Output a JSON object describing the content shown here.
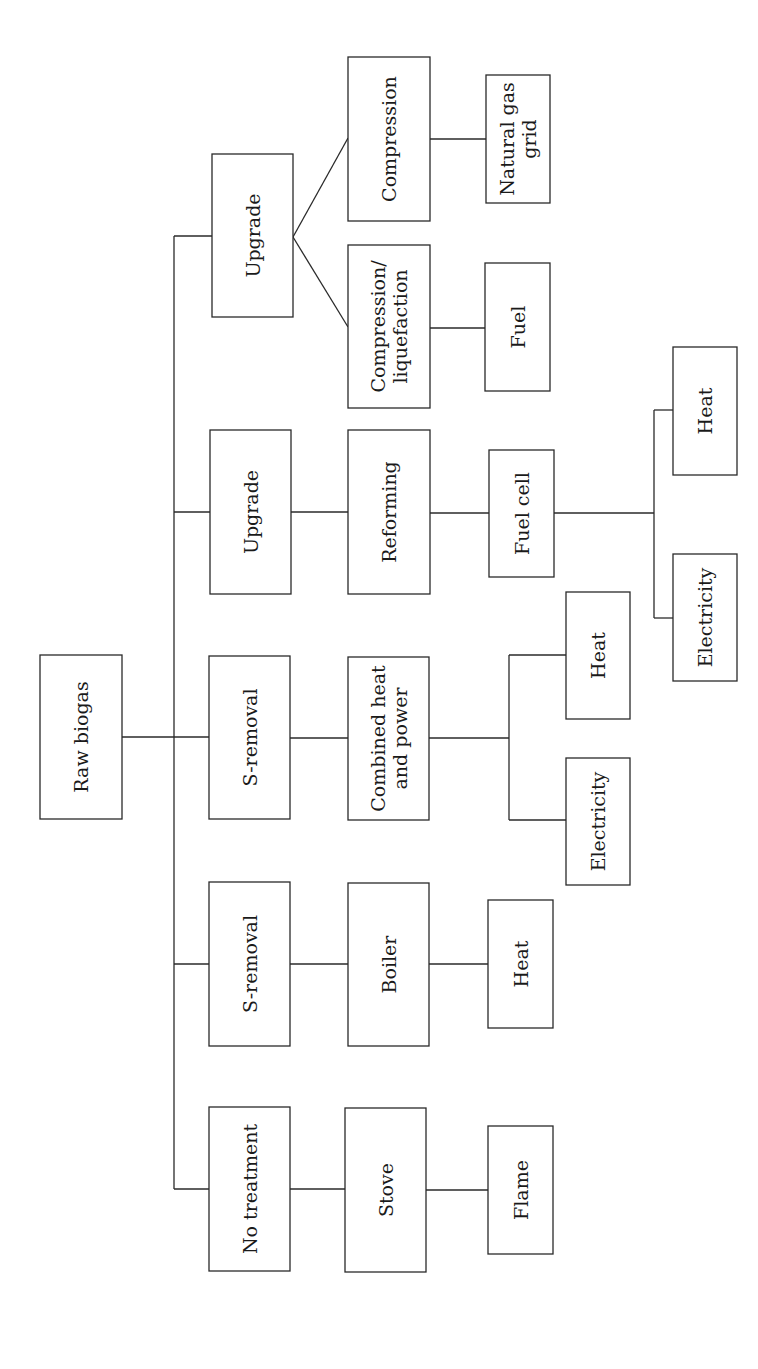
{
  "diagram": {
    "type": "flowchart",
    "orientation": "rotated-90-ccw",
    "root": "Raw biogas",
    "nodes": {
      "raw_biogas": [
        "Raw biogas"
      ],
      "no_treatment": [
        "No treatment"
      ],
      "stove": [
        "Stove"
      ],
      "flame": [
        "Flame"
      ],
      "s_removal_boiler": [
        "S-removal"
      ],
      "boiler": [
        "Boiler"
      ],
      "heat_boiler": [
        "Heat"
      ],
      "s_removal_chp": [
        "S-removal"
      ],
      "chp": [
        "Combined heat",
        "and power"
      ],
      "heat_chp": [
        "Heat"
      ],
      "electricity_chp": [
        "Electricity"
      ],
      "upgrade_fc": [
        "Upgrade"
      ],
      "reforming": [
        "Reforming"
      ],
      "fuel_cell": [
        "Fuel cell"
      ],
      "heat_fc": [
        "Heat"
      ],
      "electricity_fc": [
        "Electricity"
      ],
      "upgrade_gas": [
        "Upgrade"
      ],
      "compression_liquefaction": [
        "Compression/",
        "liquefaction"
      ],
      "fuel": [
        "Fuel"
      ],
      "compression": [
        "Compression"
      ],
      "natural_gas_grid": [
        "Natural gas",
        "grid"
      ]
    },
    "edges": [
      [
        "raw_biogas",
        "no_treatment"
      ],
      [
        "raw_biogas",
        "s_removal_boiler"
      ],
      [
        "raw_biogas",
        "s_removal_chp"
      ],
      [
        "raw_biogas",
        "upgrade_fc"
      ],
      [
        "raw_biogas",
        "upgrade_gas"
      ],
      [
        "no_treatment",
        "stove"
      ],
      [
        "stove",
        "flame"
      ],
      [
        "s_removal_boiler",
        "boiler"
      ],
      [
        "boiler",
        "heat_boiler"
      ],
      [
        "s_removal_chp",
        "chp"
      ],
      [
        "chp",
        "heat_chp"
      ],
      [
        "chp",
        "electricity_chp"
      ],
      [
        "upgrade_fc",
        "reforming"
      ],
      [
        "reforming",
        "fuel_cell"
      ],
      [
        "fuel_cell",
        "heat_fc"
      ],
      [
        "fuel_cell",
        "electricity_fc"
      ],
      [
        "upgrade_gas",
        "compression_liquefaction"
      ],
      [
        "upgrade_gas",
        "compression"
      ],
      [
        "compression_liquefaction",
        "fuel"
      ],
      [
        "compression",
        "natural_gas_grid"
      ]
    ]
  }
}
